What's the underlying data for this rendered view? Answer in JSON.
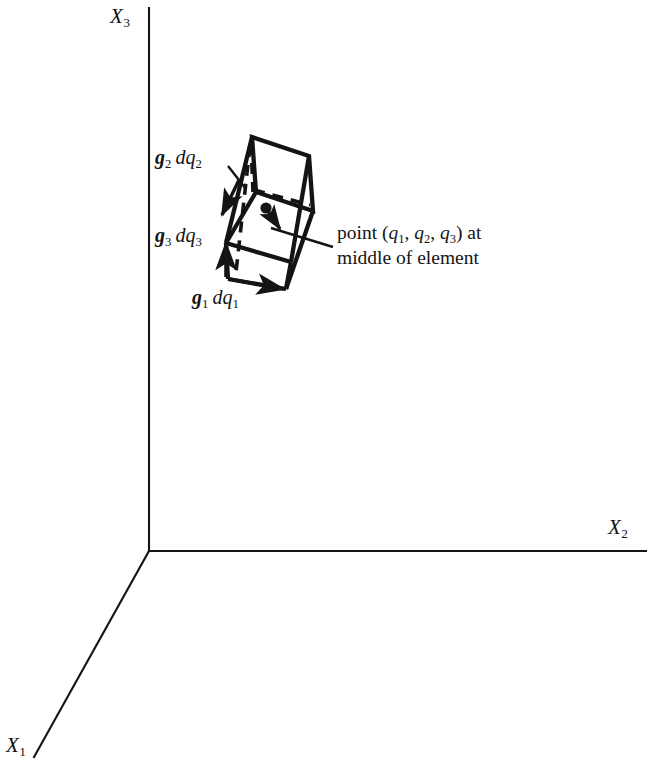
{
  "figure": {
    "kind": "3d-coordinate-diagram",
    "background_color": "#ffffff",
    "ink_color": "#141414",
    "axes": {
      "x3_label": "X",
      "x3_sub": "3",
      "x2_label": "X",
      "x2_sub": "2",
      "x1_label": "X",
      "x1_sub": "1"
    },
    "vectors": [
      {
        "id": "g2dq2",
        "g": "g",
        "g_sub": "2",
        "dq": "dq",
        "dq_sub": "2"
      },
      {
        "id": "g3dq3",
        "g": "g",
        "g_sub": "3",
        "dq": "dq",
        "dq_sub": "3"
      },
      {
        "id": "g1dq1",
        "g": "g",
        "g_sub": "1",
        "dq": "dq",
        "dq_sub": "1"
      }
    ],
    "annotation": {
      "line1_prefix": "point (",
      "q1": "q",
      "q1_sub": "1",
      "sep1": ", ",
      "q2": "q",
      "q2_sub": "2",
      "sep2": ", ",
      "q3": "q",
      "q3_sub": "3",
      "line1_suffix": ") at",
      "line2": "middle of element"
    }
  }
}
